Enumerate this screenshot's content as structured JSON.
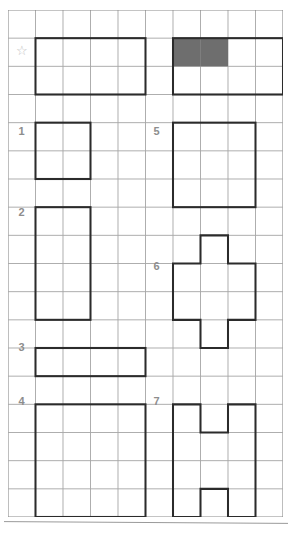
{
  "page": {
    "header_fragment": "",
    "background_color": "#ffffff"
  },
  "grid": {
    "columns": 10,
    "rows": 18,
    "cell_size": 27,
    "origin_x": 8,
    "origin_y": 10,
    "line_color": "#a8a8a8",
    "border_color": "#8a8a8a"
  },
  "style": {
    "shape_stroke_color": "#2b2b2b",
    "shape_stroke_width": 2,
    "shaded_fill_color": "#6e6e6e",
    "label_color": "#8d8d8d",
    "star_color": "#bdbdbd",
    "rule_color": "#9a9a9a"
  },
  "labels": [
    {
      "name": "star",
      "text": "☆",
      "col": 0,
      "row": 1
    },
    {
      "name": "label-1",
      "text": "1",
      "col": 0,
      "row": 4
    },
    {
      "name": "label-2",
      "text": "2",
      "col": 0,
      "row": 7
    },
    {
      "name": "label-3",
      "text": "3",
      "col": 0,
      "row": 12
    },
    {
      "name": "label-4",
      "text": "4",
      "col": 0,
      "row": 14
    },
    {
      "name": "label-5",
      "text": "5",
      "col": 5,
      "row": 4
    },
    {
      "name": "label-6",
      "text": "6",
      "col": 5,
      "row": 9
    },
    {
      "name": "label-7",
      "text": "7",
      "col": 5,
      "row": 14
    }
  ],
  "shapes": [
    {
      "id": "example-left",
      "label": "☆",
      "type": "rectangle",
      "col": 1,
      "row": 1,
      "width_cells": 4,
      "height_cells": 2,
      "area_cells": 8,
      "shaded_cells": []
    },
    {
      "id": "example-right",
      "label": "☆",
      "type": "rectangle",
      "col": 6,
      "row": 1,
      "width_cells": 4,
      "height_cells": 2,
      "area_cells": 8,
      "shaded_cells": [
        {
          "col": 6,
          "row": 1
        },
        {
          "col": 7,
          "row": 1
        }
      ]
    },
    {
      "id": "shape-1",
      "label": "1",
      "type": "rectangle",
      "col": 1,
      "row": 4,
      "width_cells": 2,
      "height_cells": 2,
      "area_cells": 4,
      "shaded_cells": []
    },
    {
      "id": "shape-2",
      "label": "2",
      "type": "rectangle",
      "col": 1,
      "row": 7,
      "width_cells": 2,
      "height_cells": 4,
      "area_cells": 8,
      "shaded_cells": []
    },
    {
      "id": "shape-3",
      "label": "3",
      "type": "rectangle",
      "col": 1,
      "row": 12,
      "width_cells": 4,
      "height_cells": 1,
      "area_cells": 4,
      "shaded_cells": []
    },
    {
      "id": "shape-4",
      "label": "4",
      "type": "rectangle",
      "col": 1,
      "row": 14,
      "width_cells": 4,
      "height_cells": 4,
      "area_cells": 16,
      "shaded_cells": []
    },
    {
      "id": "shape-5",
      "label": "5",
      "type": "rectangle",
      "col": 6,
      "row": 4,
      "width_cells": 3,
      "height_cells": 3,
      "area_cells": 9,
      "shaded_cells": []
    },
    {
      "id": "shape-6",
      "label": "6",
      "type": "cross",
      "col": 6,
      "row": 8,
      "width_cells": 3,
      "height_cells": 4,
      "area_cells": 8,
      "points_cells": "1,0 2,0 2,1 3,1 3,3 2,3 2,4 1,4 1,3 0,3 0,1 1,1",
      "shaded_cells": []
    },
    {
      "id": "shape-7",
      "label": "7",
      "type": "h-shape",
      "col": 6,
      "row": 14,
      "width_cells": 3,
      "height_cells": 4,
      "area_cells": 10,
      "points_cells": "0,0 1,0 1,1 2,1 2,0 3,0 3,4 2,4 2,3 1,3 1,4 0,4",
      "shaded_cells": []
    }
  ]
}
